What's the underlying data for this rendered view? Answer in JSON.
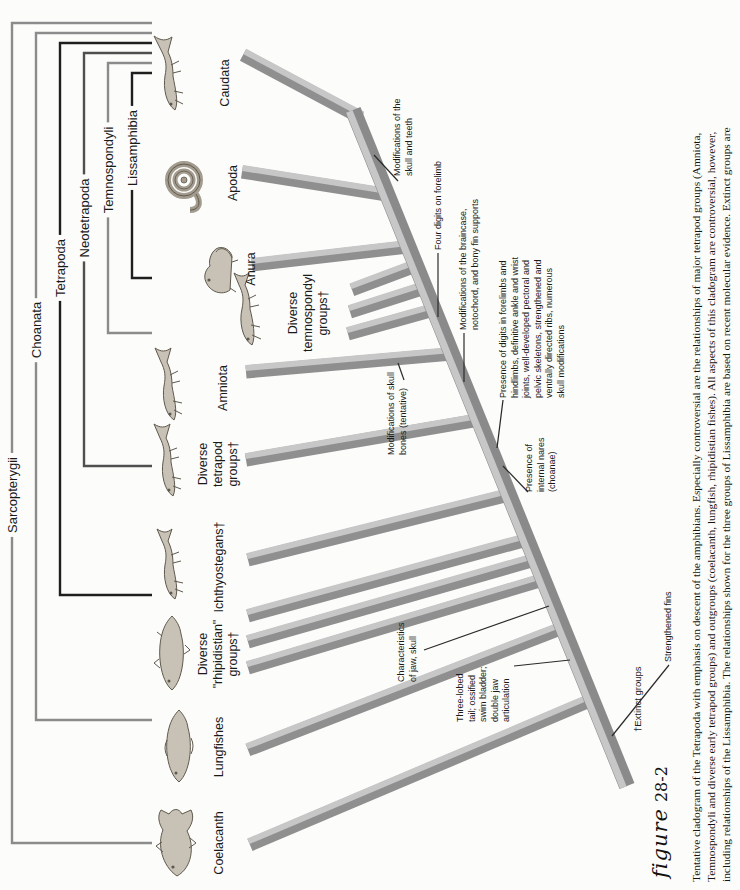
{
  "figure_label": {
    "script": "figure",
    "number": "28-2"
  },
  "caption": {
    "lines": [
      "Tentative cladogram of the Tetrapoda with emphasis on descent of the amphibians. Especially controversial are the relationships of major tetrapod groups (Amniota,",
      "Temnospondyli and diverse early tetrapod groups) and outgroups (coelacanth, lungfish, rhipidistian fishes). All aspects of this cladogram are controversial, however,",
      "including relationships of the Lissamphibia. The relationships shown for the three groups of Lissamphibia are based on recent molecular evidence. Extinct groups are"
    ]
  },
  "brackets": [
    {
      "label": "Sarcopterygii"
    },
    {
      "label": "Choanata"
    },
    {
      "label": "Tetrapoda"
    },
    {
      "label": "Neotetrapoda"
    },
    {
      "label": "Temnospondyli"
    },
    {
      "label": "Lissamphibia"
    }
  ],
  "taxa": [
    {
      "label": "Coelacanth"
    },
    {
      "label": "Lungfishes"
    },
    {
      "label": "Diverse\n\"rhipidistian\"\ngroups†"
    },
    {
      "label": "Ichthyostegans†"
    },
    {
      "label": "Diverse\ntetrapod\ngroups†"
    },
    {
      "label": "Amniota"
    },
    {
      "label": "Diverse\ntemnospondyl\ngroups†"
    },
    {
      "label": "Anura"
    },
    {
      "label": "Apoda"
    },
    {
      "label": "Caudata"
    }
  ],
  "annotations": [
    {
      "text": "Strengthened fins"
    },
    {
      "text": "Three-lobed\ntail; ossified\nswim bladder;\ndouble jaw\narticulation"
    },
    {
      "text": "Characteristics\nof jaw, skull"
    },
    {
      "text": "Presence of\ninternal nares\n(choanae)"
    },
    {
      "text": "Presence of digits in forelimbs and\nhindlimbs, definitive ankle and wrist\njoints, well-developed pectoral and\npelvic skeletons, strengthened and\nventrally directed ribs, numerous\nskull modifications"
    },
    {
      "text": "Modifications of skull\nbones (tentative)"
    },
    {
      "text": "Modifications of the braincase,\nnotochord, and bony fin supports"
    },
    {
      "text": "Four digits on forelimb"
    },
    {
      "text": "Modifications of the\nskull and teeth"
    }
  ],
  "footnote": "†Extinct groups",
  "colors": {
    "background": "#fcfcfa",
    "band_light": "#c7c7c7",
    "band_dark": "#8f8f8f",
    "bracket_gray": "#8b8b8b",
    "bracket_dark": "#4f4f4f",
    "line_black": "#1e1e1e",
    "text": "#1a1a1a"
  }
}
